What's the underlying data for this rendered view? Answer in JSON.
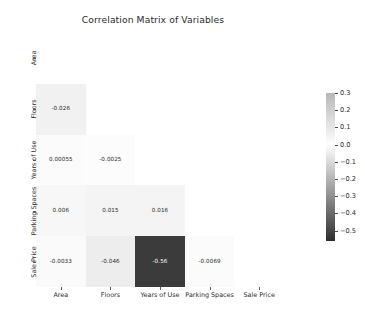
{
  "figure": {
    "title": "Correlation Matrix of Variables",
    "background": "#ffffff"
  },
  "chart_data": {
    "type": "heatmap",
    "title": "Correlation Matrix of Variables",
    "xlabel": "",
    "ylabel": "",
    "categories": [
      "Area",
      "Floors",
      "Years of Use",
      "Parking Spaces",
      "Sale Price"
    ],
    "x_tick_labels": [
      "Area",
      "Floors",
      "Years of Use",
      "Parking Spaces",
      "Sale Price"
    ],
    "y_tick_labels": [
      "Area",
      "Floors",
      "Years of Use",
      "Parking Spaces",
      "Sale Price"
    ],
    "mask": "upper-triangle-including-diagonal",
    "grid": false,
    "colormap": "greys",
    "vmin": -0.56,
    "vmax": 0.3,
    "annotate": true,
    "matrix": [
      [
        null,
        null,
        null,
        null,
        null
      ],
      [
        "-0.026",
        null,
        null,
        null,
        null
      ],
      [
        "0.00055",
        "-0.0025",
        null,
        null,
        null
      ],
      [
        "0.006",
        "0.015",
        "0.016",
        null,
        null
      ],
      [
        "-0.0033",
        "-0.046",
        "-0.56",
        "-0.0069",
        null
      ]
    ],
    "values": [
      [
        null,
        null,
        null,
        null,
        null
      ],
      [
        -0.026,
        null,
        null,
        null,
        null
      ],
      [
        0.00055,
        -0.0025,
        null,
        null,
        null
      ],
      [
        0.006,
        0.015,
        0.016,
        null,
        null
      ],
      [
        -0.0033,
        -0.046,
        -0.56,
        -0.0069,
        null
      ]
    ],
    "cell_colors": [
      [
        null,
        null,
        null,
        null,
        null
      ],
      [
        "#f1f1f1",
        null,
        null,
        null,
        null
      ],
      [
        "#fbfbfb",
        "#fcfcfc",
        null,
        null,
        null
      ],
      [
        "#f7f7f7",
        "#f4f4f4",
        "#f4f4f4",
        null,
        null
      ],
      [
        "#fafafa",
        "#ededed",
        "#3b3b3b",
        "#fbfbfb",
        null
      ]
    ],
    "text_colors": [
      [
        null,
        null,
        null,
        null,
        null
      ],
      [
        "#262626",
        null,
        null,
        null,
        null
      ],
      [
        "#262626",
        "#262626",
        null,
        null,
        null
      ],
      [
        "#262626",
        "#262626",
        "#262626",
        null,
        null
      ],
      [
        "#262626",
        "#262626",
        "#ffffff",
        "#262626",
        null
      ]
    ],
    "colorbar": {
      "position": "right",
      "ticks": [
        "0.3",
        "0.2",
        "0.1",
        "0.0",
        "-0.1",
        "-0.2",
        "-0.3",
        "-0.4",
        "-0.5"
      ],
      "tick_values": [
        0.3,
        0.2,
        0.1,
        0.0,
        -0.1,
        -0.2,
        -0.3,
        -0.4,
        -0.5
      ],
      "min_label": "-0.5",
      "max_label": "0.3",
      "gradient_top_color": "#b7b7b7",
      "gradient_mid_color": "#ffffff",
      "gradient_bottom_color": "#2e2e2e"
    }
  }
}
